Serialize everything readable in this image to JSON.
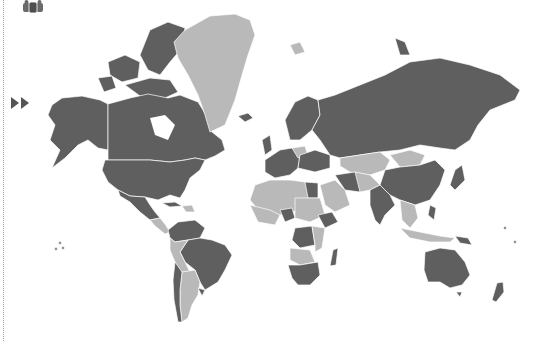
{
  "map": {
    "type": "choropleth world map",
    "projection": "mercator",
    "colors": {
      "category_dark": "#5f5f5f",
      "category_light": "#b9b9b9",
      "borders": "#ffffff",
      "background": "#ffffff"
    },
    "regions": {
      "dark": [
        "United States",
        "Canada",
        "Alaska",
        "Mexico",
        "Cuba",
        "Colombia",
        "Venezuela",
        "Brazil",
        "Chile",
        "Uruguay",
        "Russia",
        "China",
        "Western Europe",
        "Scandinavia",
        "Iceland",
        "Egypt",
        "Iran",
        "India",
        "Ethiopia",
        "DR Congo",
        "Nigeria",
        "Southern Africa",
        "Madagascar",
        "Japan",
        "Australia",
        "New Zealand",
        "Papua New Guinea"
      ],
      "light": [
        "Greenland",
        "Peru",
        "Bolivia",
        "Argentina",
        "Paraguay",
        "Central America",
        "North Africa",
        "West Africa",
        "East Africa",
        "Arabian Peninsula",
        "Mongolia",
        "Kazakhstan",
        "Central Asia",
        "Southeast Asia",
        "Indonesia",
        "Svalbard",
        "Poland"
      ]
    }
  },
  "controls": {
    "group_icon": "people-group-icon",
    "play_icon": "fast-forward-icon"
  }
}
